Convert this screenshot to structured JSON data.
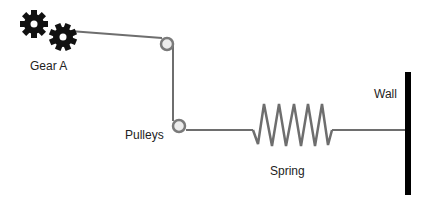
{
  "diagram": {
    "labels": {
      "gear": "Gear A",
      "pulleys": "Pulleys",
      "spring": "Spring",
      "wall": "Wall"
    },
    "colors": {
      "line": "#6e6e6e",
      "gear": "#111111",
      "wall": "#000000",
      "pulley_fill": "#ececec",
      "pulley_stroke": "#7a7a7a"
    }
  }
}
